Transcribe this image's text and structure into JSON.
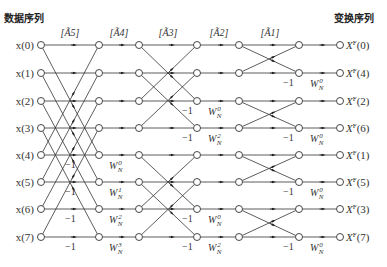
{
  "headers": {
    "input_title": "数据序列",
    "output_title": "变换序列"
  },
  "stages": [
    {
      "label": "[Ã5]",
      "x": 97
    },
    {
      "label": "[Ã4]",
      "x": 122
    },
    {
      "label": "[Ã3]",
      "x": 168
    },
    {
      "label": "[Ã2]",
      "x": 220
    },
    {
      "label": "[Ã1]",
      "x": 270
    }
  ],
  "inputs": [
    "x(0)",
    "x(1)",
    "x(2)",
    "x(3)",
    "x(4)",
    "x(5)",
    "x(6)",
    "x(7)"
  ],
  "outputs": [
    "X^F(0)",
    "X^F(4)",
    "X^F(2)",
    "X^F(6)",
    "X^F(1)",
    "X^F(5)",
    "X^F(3)",
    "X^F(7)"
  ],
  "twiddles_stage1": [
    "W_N^0",
    "W_N^1",
    "W_N^2",
    "W_N^3"
  ],
  "twiddles_stage2": [
    "W_N^0",
    "W_N^2",
    "W_N^0",
    "W_N^2"
  ],
  "twiddles_stage3": [
    "W_N^0",
    "W_N^0",
    "W_N^0",
    "W_N^0"
  ],
  "neg_one": "−1",
  "colors": {
    "line": "#333333",
    "node_fill": "#ffffff"
  }
}
